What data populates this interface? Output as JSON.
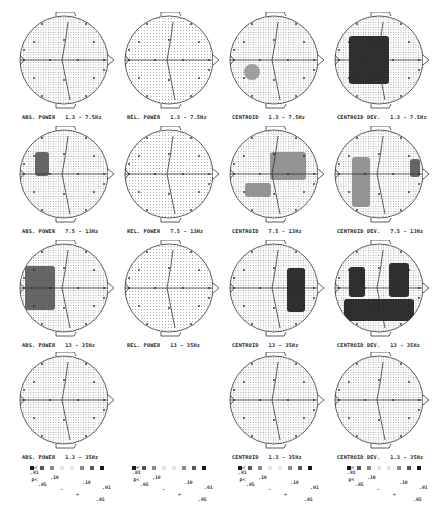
{
  "figure": {
    "rows": [
      {
        "band": "1.3 - 7.5Hz",
        "maps": [
          {
            "label": "ABS. POWER   1.3 - 7.5Hz",
            "type": "abs-power",
            "blobs": []
          },
          {
            "label": "REL. POWER   1.3 - 7.5Hz",
            "type": "rel-power",
            "blobs": []
          },
          {
            "label": "CENTROID   1.3 - 7.5Hz",
            "type": "centroid",
            "blobs": [
              {
                "x": -22,
                "y": 12,
                "r": 8,
                "level": "p10"
              }
            ]
          },
          {
            "label": "CENTROID DEV.   1.3 - 7.5Hz",
            "type": "centroid-dev",
            "blobs": [
              {
                "x": -10,
                "y": 0,
                "w": 40,
                "h": 48,
                "level": "p01"
              }
            ]
          }
        ]
      },
      {
        "band": "7.5 - 13Hz",
        "maps": [
          {
            "label": "ABS. POWER   7.5 - 13Hz",
            "type": "abs-power",
            "blobs": [
              {
                "x": -22,
                "y": -10,
                "w": 14,
                "h": 24,
                "level": "p05"
              }
            ]
          },
          {
            "label": "REL. POWER   7.5 - 13Hz",
            "type": "rel-power",
            "blobs": []
          },
          {
            "label": "CENTROID   7.5 - 13Hz",
            "type": "centroid",
            "blobs": [
              {
                "x": 14,
                "y": -8,
                "w": 36,
                "h": 28,
                "level": "p10"
              },
              {
                "x": -16,
                "y": 16,
                "w": 26,
                "h": 14,
                "level": "p10"
              }
            ]
          },
          {
            "label": "CENTROID DEV.   7.5 - 13Hz",
            "type": "centroid-dev",
            "blobs": [
              {
                "x": -18,
                "y": 8,
                "w": 18,
                "h": 50,
                "level": "p10"
              },
              {
                "x": 36,
                "y": -6,
                "w": 10,
                "h": 18,
                "level": "p05"
              }
            ]
          }
        ]
      },
      {
        "band": "13 - 35Hz",
        "maps": [
          {
            "label": "ABS. POWER   13 - 35Hz",
            "type": "abs-power",
            "blobs": [
              {
                "x": -24,
                "y": 0,
                "w": 30,
                "h": 44,
                "level": "p05"
              }
            ]
          },
          {
            "label": "REL. POWER   13 - 35Hz",
            "type": "rel-power",
            "blobs": []
          },
          {
            "label": "CENTROID   13 - 35Hz",
            "type": "centroid",
            "blobs": [
              {
                "x": 22,
                "y": 2,
                "w": 18,
                "h": 44,
                "level": "p01"
              }
            ]
          },
          {
            "label": "CENTROID DEV.   13 - 35Hz",
            "type": "centroid-dev",
            "blobs": [
              {
                "x": -22,
                "y": -6,
                "w": 16,
                "h": 30,
                "level": "p01"
              },
              {
                "x": 20,
                "y": -8,
                "w": 20,
                "h": 34,
                "level": "p01"
              },
              {
                "x": 0,
                "y": 22,
                "w": 70,
                "h": 22,
                "level": "p01"
              }
            ]
          }
        ]
      },
      {
        "band": "1.3 - 35Hz",
        "maps": [
          {
            "label": "ABS. POWER   1.3 - 35Hz",
            "type": "abs-power",
            "blobs": []
          },
          null,
          {
            "label": "CENTROID   1.3 - 35Hz",
            "type": "centroid",
            "blobs": []
          },
          {
            "label": "CENTROID DEV.   1.3 - 35Hz",
            "type": "centroid-dev",
            "blobs": []
          }
        ]
      }
    ],
    "legend": {
      "top_prefix": "p<",
      "top_values": [
        ".01",
        ".10",
        ".10",
        ".01"
      ],
      "bottom_prefix": "p<",
      "bottom_values": [
        ".05",
        "-",
        "+",
        ".05"
      ],
      "levels": [
        "p01",
        "p05",
        "p10",
        "ns",
        "ns",
        "p10",
        "p05",
        "p01"
      ]
    },
    "colors": {
      "outline": "#333333",
      "dot": "#999999",
      "p01": "#1a1a1a",
      "p05": "#555555",
      "p10": "#8a8a8a",
      "electrode": "#222222"
    }
  }
}
